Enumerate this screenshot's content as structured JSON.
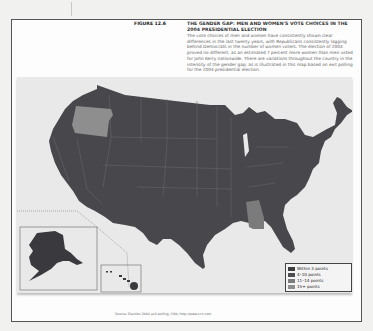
{
  "figure": {
    "number": "FIGURE 12.6",
    "title": "THE GENDER GAP: MEN AND WOMEN'S VOTE CHOICES IN THE 2004 PRESIDENTIAL ELECTION",
    "body": "The vote choices of men and women have consistently shown clear differences in the last twenty years, with Republicans consistently lagging behind Democrats in the number of women voters. The election of 2004 proved no different, as an estimated 7 percent more women than men voted for John Kerry nationwide. There are variations throughout the country in the intensity of the gender gap, as is illustrated in this map based on exit polling for the 2004 presidential election.",
    "source": "Source: Election 2004 exit polling, CNN, http://www.cnn.com"
  },
  "legend": {
    "items": [
      {
        "label": "Within 3 points",
        "color": "#3e3e42"
      },
      {
        "label": "4–10 points",
        "color": "#4d4d52"
      },
      {
        "label": "11–14 points",
        "color": "#7b7b7b"
      },
      {
        "label": "15+ points",
        "color": "#8e8e8e"
      }
    ]
  },
  "map": {
    "base_color": "#47474c",
    "highlighted_states": [
      {
        "state": "Oregon",
        "category": "15+ points",
        "color": "#8e8e8e"
      },
      {
        "state": "Alabama",
        "category": "11–14 points",
        "color": "#7b7b7b"
      }
    ],
    "insets": [
      "Alaska",
      "Hawaii"
    ]
  }
}
